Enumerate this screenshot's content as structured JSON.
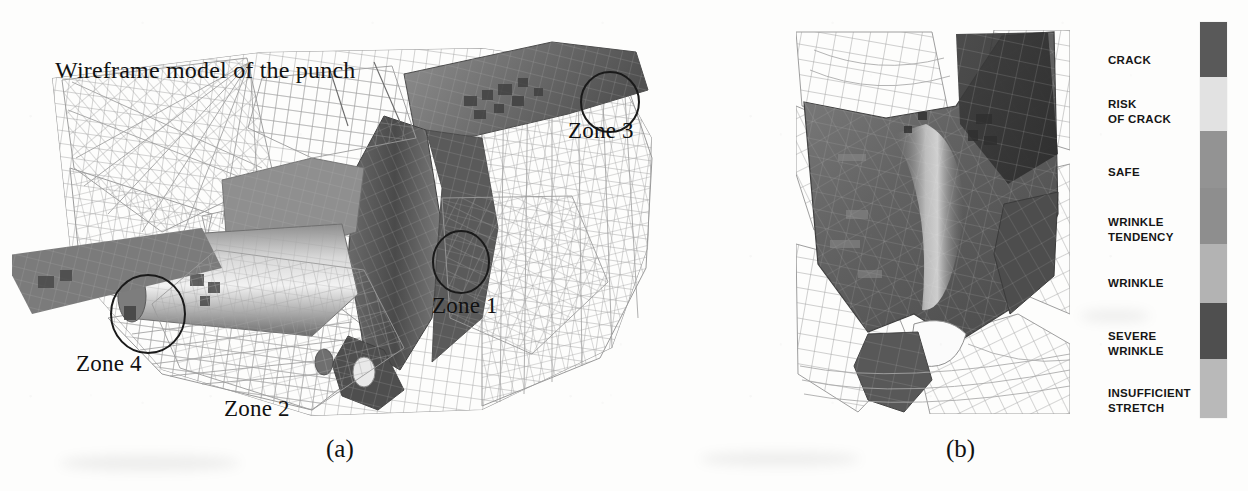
{
  "figure": {
    "kind": "scientific-figure",
    "background_color": "#fdfdfc"
  },
  "panel_a": {
    "caption": "(a)",
    "title_annotation": "Wireframe model of the punch",
    "zone_annotations": [
      {
        "label": "Zone 3",
        "x": 568,
        "y": 110,
        "circle_cx": 598,
        "circle_cy": 84,
        "circle_r": 28
      },
      {
        "label": "Zone 1",
        "x": 432,
        "y": 285,
        "circle_cx": 449,
        "circle_cy": 244,
        "circle_r": 29
      },
      {
        "label": "Zone 4",
        "x": 76,
        "y": 343,
        "circle_cx": 136,
        "circle_cy": 296,
        "circle_r": 36
      },
      {
        "label": "Zone 2",
        "x": 224,
        "y": 388,
        "circle_cx": null,
        "circle_cy": null,
        "circle_r": null
      }
    ]
  },
  "panel_b": {
    "caption": "(b)"
  },
  "legend": {
    "title": "forming limit severity scale",
    "bands": [
      {
        "label_lines": [
          "CRACK"
        ],
        "color": "#595959",
        "height_pct": 14.0,
        "label_y": 40
      },
      {
        "label_lines": [
          "RISK",
          "OF CRACK"
        ],
        "color": "#e2e2e2",
        "height_pct": 13.5,
        "label_y": 84
      },
      {
        "label_lines": [
          "SAFE"
        ],
        "color": "#939393",
        "height_pct": 14.5,
        "label_y": 152
      },
      {
        "label_lines": [
          "WRINKLE",
          "TENDENCY"
        ],
        "color": "#8e8e8e",
        "height_pct": 14.0,
        "label_y": 202
      },
      {
        "label_lines": [
          "WRINKLE"
        ],
        "color": "#b3b3b3",
        "height_pct": 15.0,
        "label_y": 263
      },
      {
        "label_lines": [
          "SEVERE",
          "WRINKLE"
        ],
        "color": "#4f4f4f",
        "height_pct": 14.0,
        "label_y": 316
      },
      {
        "label_lines": [
          "INSUFFICIENT",
          "STRETCH"
        ],
        "color": "#b9b9b9",
        "height_pct": 15.0,
        "label_y": 373
      }
    ]
  },
  "colors": {
    "ink": "#111111",
    "mesh_line": "#8d8d8d",
    "mesh_line_dark": "#5e5e5e",
    "surface_dark": "#555555",
    "surface_mid": "#8a8a8a",
    "surface_light": "#cfcfcf",
    "paper": "#fdfdfc"
  }
}
